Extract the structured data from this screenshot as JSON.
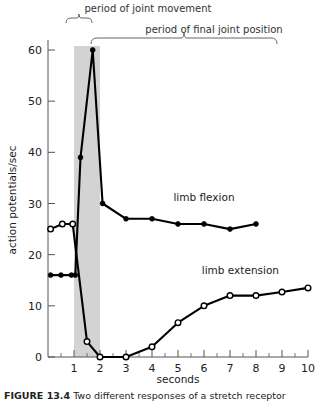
{
  "figure": {
    "caption_label": "FIGURE 13.4",
    "caption_text": "Two different responses of a stretch receptor"
  },
  "chart_data": {
    "type": "line",
    "title": "",
    "xlabel": "seconds",
    "ylabel": "action potentials/sec",
    "xlim": [
      0,
      10
    ],
    "ylim": [
      0,
      64
    ],
    "yticks": [
      0,
      10,
      20,
      30,
      40,
      50,
      60
    ],
    "xticks": [
      1,
      2,
      3,
      4,
      5,
      6,
      7,
      8,
      9,
      10
    ],
    "minor_xticks": true,
    "grid": false,
    "legend_position": "inline-annotation",
    "series": [
      {
        "name": "limb flexion",
        "marker": "filled-circle",
        "label_x": 6.0,
        "label_y": 30.5,
        "points": [
          {
            "x": 0.1,
            "y": 16
          },
          {
            "x": 0.5,
            "y": 16
          },
          {
            "x": 0.9,
            "y": 16
          },
          {
            "x": 1.05,
            "y": 16
          },
          {
            "x": 1.25,
            "y": 39
          },
          {
            "x": 1.72,
            "y": 60
          },
          {
            "x": 2.1,
            "y": 30
          },
          {
            "x": 3.0,
            "y": 27
          },
          {
            "x": 4.0,
            "y": 27
          },
          {
            "x": 5.0,
            "y": 26
          },
          {
            "x": 6.0,
            "y": 26
          },
          {
            "x": 7.0,
            "y": 25
          },
          {
            "x": 8.0,
            "y": 26
          }
        ]
      },
      {
        "name": "limb extension",
        "marker": "open-circle",
        "label_x": 7.4,
        "label_y": 16.2,
        "points": [
          {
            "x": 0.1,
            "y": 25
          },
          {
            "x": 0.55,
            "y": 26
          },
          {
            "x": 0.95,
            "y": 26
          },
          {
            "x": 1.5,
            "y": 3
          },
          {
            "x": 2.0,
            "y": 0
          },
          {
            "x": 3.0,
            "y": 0
          },
          {
            "x": 4.0,
            "y": 2
          },
          {
            "x": 5.0,
            "y": 6.7
          },
          {
            "x": 6.0,
            "y": 10
          },
          {
            "x": 7.0,
            "y": 12
          },
          {
            "x": 8.0,
            "y": 12
          },
          {
            "x": 9.0,
            "y": 12.7
          },
          {
            "x": 10.0,
            "y": 13.5
          }
        ]
      }
    ],
    "annotations": [
      {
        "name": "period-of-joint-movement",
        "text": "period of joint movement",
        "span_start": 1,
        "span_end": 2,
        "bracket": "top"
      },
      {
        "name": "period-of-final-joint-position",
        "text": "period of final joint position",
        "span_start": 2,
        "span_end": 10,
        "bracket": "top"
      }
    ],
    "shaded_band": {
      "name": "joint-movement-band",
      "x_start": 1,
      "x_end": 2,
      "color": "#d3d3d3"
    }
  },
  "colors": {
    "line": "#000000",
    "axis": "#555555",
    "band": "#d3d3d3",
    "marker_fill_open": "#ffffff",
    "text": "#222222"
  }
}
